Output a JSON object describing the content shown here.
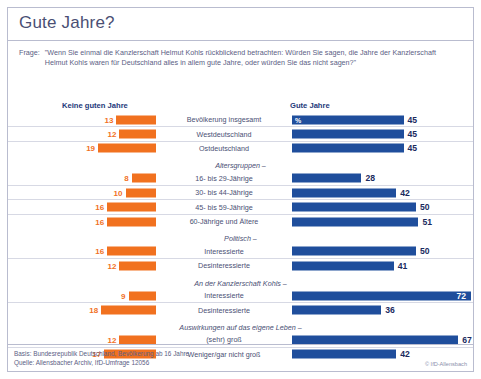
{
  "title": "Gute Jahre?",
  "question": {
    "label": "Frage:",
    "text": "\"Wenn Sie einmal die Kanzlerschaft Helmut Kohls rückblickend betrachten: Würden Sie sagen, die Jahre der Kanzlerschaft Helmut Kohls waren für Deutschland alles in allem gute Jahre, oder würden Sie das nicht sagen?\""
  },
  "headers": {
    "left": "Keine guten Jahre",
    "right": "Gute Jahre",
    "percent_symbol": "%"
  },
  "footer": {
    "basis": "Basis: Bundesrepublik Deutschland, Bevölkerung ab 16 Jahre",
    "quelle": "Quelle: Allensbacher Archiv, IfD-Umfrage 12056",
    "copyright": "© IfD-Allensbach"
  },
  "colors": {
    "negative": "#f1711f",
    "positive": "#1f4e9c",
    "text": "#4a4f74",
    "heading": "#23397a",
    "frame": "#b9bccf"
  },
  "chart_data": {
    "type": "bar",
    "title": "Gute Jahre?",
    "xlabel": "",
    "ylabel": "",
    "xlim": [
      0,
      100
    ],
    "grid": false,
    "legend_position": "top",
    "orientation": "horizontal-diverging",
    "series": [
      {
        "name": "Keine guten Jahre",
        "color": "#f1711f"
      },
      {
        "name": "Gute Jahre",
        "color": "#1f4e9c"
      }
    ],
    "groups": [
      {
        "caption": "",
        "rows": [
          {
            "category": "Bevölkerung insgesamt",
            "negative": 13,
            "positive": 45
          },
          {
            "category": "Westdeutschland",
            "negative": 12,
            "positive": 45
          },
          {
            "category": "Ostdeutschland",
            "negative": 19,
            "positive": 45
          }
        ]
      },
      {
        "caption": "Altersgruppen –",
        "rows": [
          {
            "category": "16- bis 29-Jährige",
            "negative": 8,
            "positive": 28
          },
          {
            "category": "30- bis 44-Jährige",
            "negative": 10,
            "positive": 42
          },
          {
            "category": "45- bis 59-Jährige",
            "negative": 16,
            "positive": 50
          },
          {
            "category": "60-Jährige und Ältere",
            "negative": 16,
            "positive": 51
          }
        ]
      },
      {
        "caption": "Politisch –",
        "rows": [
          {
            "category": "Interessierte",
            "negative": 16,
            "positive": 50
          },
          {
            "category": "Desinteressierte",
            "negative": 12,
            "positive": 41
          }
        ]
      },
      {
        "caption": "An der Kanzlerschaft Kohls –",
        "rows": [
          {
            "category": "Interessierte",
            "negative": 9,
            "positive": 72
          },
          {
            "category": "Desinteressierte",
            "negative": 18,
            "positive": 36
          }
        ]
      },
      {
        "caption": "Auswirkungen auf das eigene Leben –",
        "rows": [
          {
            "category": "(sehr) groß",
            "negative": 12,
            "positive": 67
          },
          {
            "category": "Weniger/gar nicht groß",
            "negative": 17,
            "positive": 42
          }
        ]
      }
    ]
  }
}
